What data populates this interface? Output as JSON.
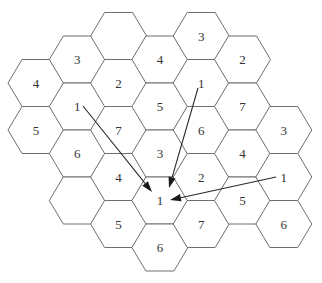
{
  "diagram": {
    "grid": {
      "origin_x": 36,
      "origin_y": 83,
      "col_spacing": 41.3,
      "row_spacing": 47,
      "hex_half_width": 28,
      "hex_half_height": 23.5
    },
    "cells": [
      {
        "col": 0,
        "row": 0,
        "label": "4"
      },
      {
        "col": 0,
        "row": 1,
        "label": "5"
      },
      {
        "col": 1,
        "row": 0,
        "label": "3"
      },
      {
        "col": 1,
        "row": 1,
        "label": "1"
      },
      {
        "col": 1,
        "row": 2,
        "label": "6"
      },
      {
        "col": 1,
        "row": 3,
        "label": ""
      },
      {
        "col": 2,
        "row": -1,
        "label": ""
      },
      {
        "col": 2,
        "row": 0,
        "label": "2"
      },
      {
        "col": 2,
        "row": 1,
        "label": "7"
      },
      {
        "col": 2,
        "row": 2,
        "label": "4"
      },
      {
        "col": 2,
        "row": 3,
        "label": "5"
      },
      {
        "col": 3,
        "row": 0,
        "label": "4"
      },
      {
        "col": 3,
        "row": 1,
        "label": "5"
      },
      {
        "col": 3,
        "row": 2,
        "label": "3"
      },
      {
        "col": 3,
        "row": 3,
        "label": "1"
      },
      {
        "col": 3,
        "row": 4,
        "label": "6"
      },
      {
        "col": 4,
        "row": -1,
        "label": "3"
      },
      {
        "col": 4,
        "row": 0,
        "label": "1"
      },
      {
        "col": 4,
        "row": 1,
        "label": "6"
      },
      {
        "col": 4,
        "row": 2,
        "label": "2"
      },
      {
        "col": 4,
        "row": 3,
        "label": "7"
      },
      {
        "col": 5,
        "row": 0,
        "label": "2"
      },
      {
        "col": 5,
        "row": 1,
        "label": "7"
      },
      {
        "col": 5,
        "row": 2,
        "label": "4"
      },
      {
        "col": 5,
        "row": 3,
        "label": "5"
      },
      {
        "col": 6,
        "row": 1,
        "label": "3"
      },
      {
        "col": 6,
        "row": 2,
        "label": "1"
      },
      {
        "col": 6,
        "row": 3,
        "label": "6"
      }
    ],
    "arrows": [
      {
        "from": [
          83,
          106
        ],
        "to": [
          152,
          192
        ],
        "label": "interference from upper-left cell 1"
      },
      {
        "from": [
          198,
          88
        ],
        "to": [
          169,
          188
        ],
        "label": "interference from upper-right cell 1"
      },
      {
        "from": [
          276,
          177
        ],
        "to": [
          170,
          200
        ],
        "label": "interference from right cell 1"
      }
    ],
    "colors": {
      "stroke": "#6e6e6e",
      "text": "#333333",
      "arrow": "#1a1a1a",
      "background": "#ffffff"
    }
  }
}
